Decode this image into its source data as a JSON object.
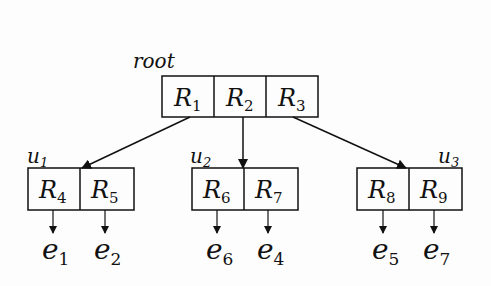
{
  "root": {
    "label": "root",
    "entries": [
      {
        "name": "R",
        "sub": "1"
      },
      {
        "name": "R",
        "sub": "2"
      },
      {
        "name": "R",
        "sub": "3"
      }
    ]
  },
  "nodes": [
    {
      "label": "u",
      "label_sub": "1",
      "entries": [
        {
          "name": "R",
          "sub": "4"
        },
        {
          "name": "R",
          "sub": "5"
        }
      ],
      "children": [
        {
          "name": "e",
          "sub": "1"
        },
        {
          "name": "e",
          "sub": "2"
        }
      ]
    },
    {
      "label": "u",
      "label_sub": "2",
      "entries": [
        {
          "name": "R",
          "sub": "6"
        },
        {
          "name": "R",
          "sub": "7"
        }
      ],
      "children": [
        {
          "name": "e",
          "sub": "6"
        },
        {
          "name": "e",
          "sub": "4"
        }
      ]
    },
    {
      "label": "u",
      "label_sub": "3",
      "entries": [
        {
          "name": "R",
          "sub": "8"
        },
        {
          "name": "R",
          "sub": "9"
        }
      ],
      "children": [
        {
          "name": "e",
          "sub": "5"
        },
        {
          "name": "e",
          "sub": "7"
        }
      ]
    }
  ],
  "colors": {
    "stroke": "#111111",
    "background": "#fdfdfd"
  }
}
